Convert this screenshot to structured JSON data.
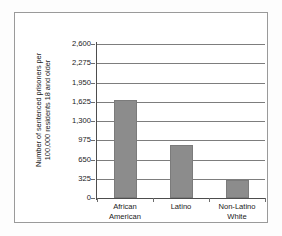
{
  "chart_data": {
    "type": "bar",
    "title": "",
    "subtitle": "",
    "xlabel": "",
    "ylabel_lines": [
      "Number of sentenced prisoners per",
      "100,000 residents 18 and older"
    ],
    "ylabel": "Number of sentenced prisoners per 100,000 residents 18 and older",
    "categories": [
      {
        "line1": "African",
        "line2": "American"
      },
      {
        "line1": "Latino",
        "line2": ""
      },
      {
        "line1": "Non-Latino",
        "line2": "White"
      }
    ],
    "category_names": [
      "African American",
      "Latino",
      "Non-Latino White"
    ],
    "values": [
      1650,
      895,
      305
    ],
    "ylim": [
      0,
      2600
    ],
    "ytick_step": 325,
    "ytick_labels": [
      "0",
      "325",
      "650",
      "975",
      "1,300",
      "1,625",
      "1,950",
      "2,275",
      "2,600"
    ],
    "ytick_values": [
      0,
      325,
      650,
      975,
      1300,
      1625,
      1950,
      2275,
      2600
    ],
    "grid": true,
    "legend": null,
    "legend_position": "none",
    "colors": {
      "bar_fill": "#8c8c8c",
      "bar_edge": "#7b7b7b",
      "gridline": "#7d7d7d",
      "axis": "#4d4d4d",
      "frame": "#9a9a9a",
      "text": "#1a1a1a",
      "background": "#ffffff"
    }
  }
}
